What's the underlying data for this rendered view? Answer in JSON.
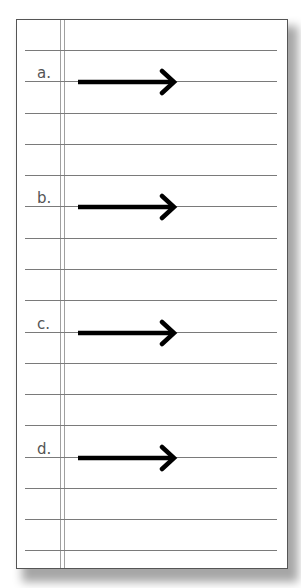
{
  "worksheet": {
    "rule_count": 17,
    "items": [
      {
        "label": "a.",
        "arrow_direction": "right",
        "line_index": 1
      },
      {
        "label": "b.",
        "arrow_direction": "right",
        "line_index": 5
      },
      {
        "label": "c.",
        "arrow_direction": "right",
        "line_index": 9
      },
      {
        "label": "d.",
        "arrow_direction": "right",
        "line_index": 13
      }
    ]
  },
  "colors": {
    "rule": "#7a7a7a",
    "margin": "#a0a0a0",
    "label": "#555555",
    "arrow": "#000000"
  }
}
